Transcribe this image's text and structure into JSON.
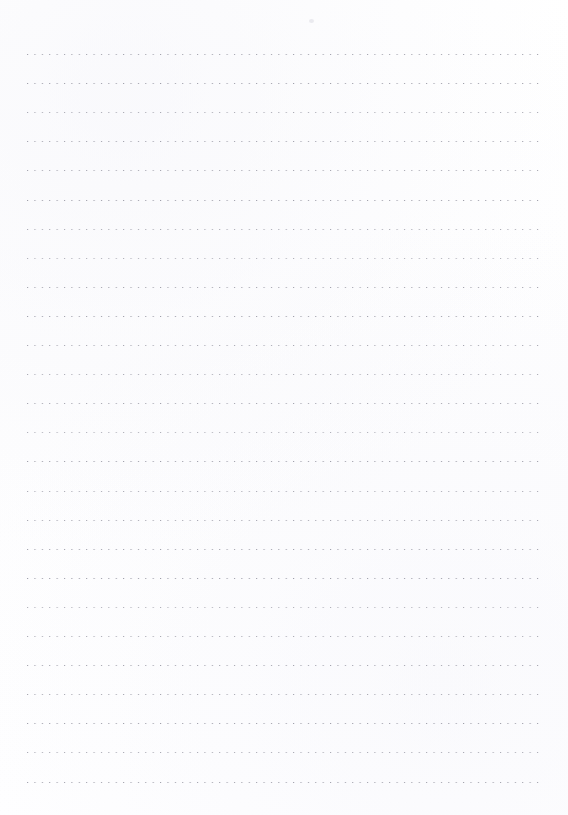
{
  "document": {
    "kind": "dotted-line-writing-paper",
    "title": "Dotted Line Writing Paper",
    "page_width_px": 568,
    "page_height_px": 815,
    "background_color": "#fefeff",
    "text_content": "",
    "has_header_text": false,
    "has_footer_text": false,
    "has_page_number": false,
    "has_margin_rule": false
  },
  "ruling": {
    "style": "dotted",
    "line_count": 26,
    "dot_color": "#9b9ba6",
    "dot_size_px": 1,
    "dot_spacing_px": 7.4,
    "line_spacing_px": 29.1,
    "first_line_y_px": 55,
    "last_line_y_px": 783,
    "line_start_x_px": 27,
    "line_end_x_px": 544,
    "line_length_px": 517,
    "top_margin_px": 55,
    "bottom_margin_px": 32,
    "left_margin_px": 27,
    "right_margin_px": 24
  },
  "artifacts": {
    "scan_speck": {
      "label": "faint scanner speck",
      "x_px": 309,
      "y_px": 19,
      "color": "#cdcdd7"
    }
  },
  "lines": [
    {
      "index": 1,
      "y": 55.0,
      "jitter": "jit-a"
    },
    {
      "index": 2,
      "y": 84.1,
      "jitter": "jit-c"
    },
    {
      "index": 3,
      "y": 113.2,
      "jitter": "jit-b"
    },
    {
      "index": 4,
      "y": 142.3,
      "jitter": "jit-a"
    },
    {
      "index": 5,
      "y": 171.4,
      "jitter": "jit-e"
    },
    {
      "index": 6,
      "y": 200.5,
      "jitter": "jit-c"
    },
    {
      "index": 7,
      "y": 229.6,
      "jitter": "jit-b"
    },
    {
      "index": 8,
      "y": 258.7,
      "jitter": "jit-d"
    },
    {
      "index": 9,
      "y": 287.8,
      "jitter": "jit-a"
    },
    {
      "index": 10,
      "y": 316.9,
      "jitter": "jit-c"
    },
    {
      "index": 11,
      "y": 346.0,
      "jitter": "jit-e"
    },
    {
      "index": 12,
      "y": 375.1,
      "jitter": "jit-b"
    },
    {
      "index": 13,
      "y": 404.2,
      "jitter": "jit-a"
    },
    {
      "index": 14,
      "y": 433.3,
      "jitter": "jit-d"
    },
    {
      "index": 15,
      "y": 462.4,
      "jitter": "jit-c"
    },
    {
      "index": 16,
      "y": 491.5,
      "jitter": "jit-b"
    },
    {
      "index": 17,
      "y": 520.6,
      "jitter": "jit-e"
    },
    {
      "index": 18,
      "y": 549.7,
      "jitter": "jit-a"
    },
    {
      "index": 19,
      "y": 578.8,
      "jitter": "jit-c"
    },
    {
      "index": 20,
      "y": 607.9,
      "jitter": "jit-d"
    },
    {
      "index": 21,
      "y": 637.0,
      "jitter": "jit-b"
    },
    {
      "index": 22,
      "y": 666.1,
      "jitter": "jit-a"
    },
    {
      "index": 23,
      "y": 695.2,
      "jitter": "jit-e"
    },
    {
      "index": 24,
      "y": 724.3,
      "jitter": "jit-c"
    },
    {
      "index": 25,
      "y": 753.4,
      "jitter": "jit-b"
    },
    {
      "index": 26,
      "y": 782.5,
      "jitter": "jit-a"
    }
  ]
}
